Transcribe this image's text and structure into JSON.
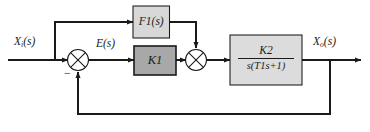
{
  "diagram": {
    "type": "control-system-block-diagram",
    "title": "",
    "colors": {
      "line": "#1a1a1a",
      "gain_block_fill": "#a8a8a8",
      "feedforward_block_fill": "#d8d8d8",
      "plant_block_fill": "#dcdcdc",
      "block_border": "#1a1a1a",
      "background": "#ffffff"
    },
    "signals": {
      "input": {
        "label": "X",
        "sub": "i",
        "arg": "(s)"
      },
      "error": {
        "label": "E",
        "sub": "",
        "arg": "(s)"
      },
      "output": {
        "label": "X",
        "sub": "o",
        "arg": "(s)"
      }
    },
    "blocks": {
      "feedforward": {
        "label": "F",
        "sub": "1",
        "arg": "(s)",
        "fill": "#d8d8d8"
      },
      "gain": {
        "label": "K",
        "sub": "1",
        "fill": "#a8a8a8"
      },
      "plant": {
        "numerator": {
          "label": "K",
          "sub": "2"
        },
        "denominator": "s(T₁s+1)",
        "denominator_parts": {
          "lead": "s(T",
          "sub": "1",
          "tail": "s+1)"
        },
        "fill": "#dcdcdc"
      }
    },
    "summing_junctions": [
      {
        "name": "error-junction",
        "signs": {
          "feedback": "−"
        }
      },
      {
        "name": "feedforward-junction",
        "signs": {}
      }
    ],
    "paths": {
      "feedforward_path": "input branch to F1(s) to second summing junction",
      "feedback_path": "output to first summing junction (unity, negative)"
    }
  }
}
